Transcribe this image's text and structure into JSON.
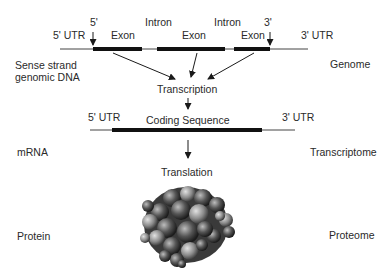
{
  "genome": {
    "five_prime": "5'",
    "three_prime": "3'",
    "utr5": "5' UTR",
    "utr3": "3' UTR",
    "exons": [
      "Exon",
      "Exon",
      "Exon"
    ],
    "introns": [
      "Intron",
      "Intron"
    ],
    "left_label_line1": "Sense strand",
    "left_label_line2": "genomic DNA",
    "right_label": "Genome"
  },
  "transcription": {
    "label": "Transcription"
  },
  "mrna": {
    "utr5": "5' UTR",
    "coding": "Coding Sequence",
    "utr3": "3' UTR",
    "left_label": "mRNA",
    "right_label": "Transcriptome"
  },
  "translation": {
    "label": "Translation"
  },
  "protein": {
    "left_label": "Protein",
    "right_label": "Proteome",
    "image": "protein-space-filling-model"
  },
  "colors": {
    "line": "#1a1a1a",
    "thin_line": "#444444",
    "text": "#2a2a2a"
  }
}
